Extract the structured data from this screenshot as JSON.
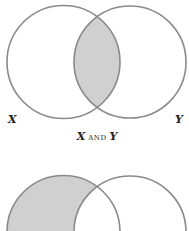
{
  "diagrams": [
    {
      "id": "intersection",
      "shaded_region": "X ∩ Y",
      "set_labels": {
        "left": "X",
        "right": "Y"
      },
      "caption": {
        "left": "X",
        "operator": "and",
        "right": "Y"
      }
    },
    {
      "id": "difference",
      "shaded_region": "X only (partially visible)",
      "set_labels": {
        "left": "",
        "right": ""
      },
      "caption": null
    }
  ],
  "colors": {
    "stroke": "#8a8a8a",
    "fill": "#d0d0d0",
    "background": "#ffffff",
    "text": "#222222"
  }
}
